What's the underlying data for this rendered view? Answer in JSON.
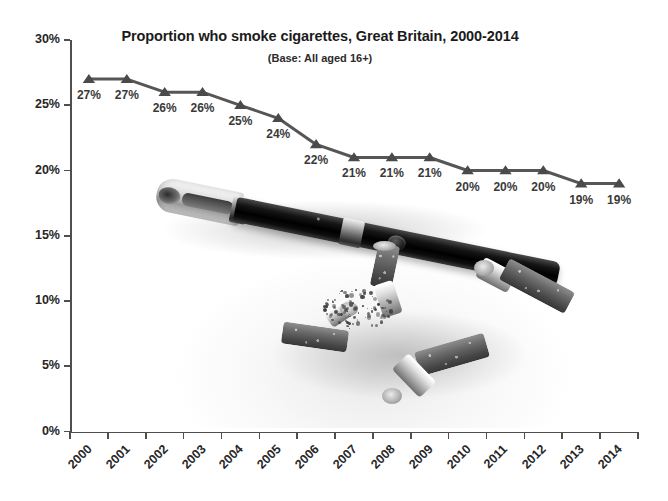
{
  "chart_data": {
    "type": "line",
    "title": "Proportion who smoke cigarettes, Great Britain, 2000-2014",
    "subtitle": "(Base: All aged 16+)",
    "xlabel": "",
    "ylabel": "",
    "categories": [
      "2000",
      "2001",
      "2002",
      "2003",
      "2004",
      "2005",
      "2006",
      "2007",
      "2008",
      "2009",
      "2010",
      "2011",
      "2012",
      "2013",
      "2014"
    ],
    "values": [
      27,
      27,
      26,
      26,
      25,
      24,
      22,
      21,
      21,
      21,
      20,
      20,
      20,
      19,
      19
    ],
    "data_labels": [
      "27%",
      "27%",
      "26%",
      "26%",
      "25%",
      "24%",
      "22%",
      "21%",
      "21%",
      "21%",
      "20%",
      "20%",
      "20%",
      "19%",
      "19%"
    ],
    "ylim": [
      0,
      30
    ],
    "ytick_values": [
      0,
      5,
      10,
      15,
      20,
      25,
      30
    ],
    "ytick_labels": [
      "0%",
      "5%",
      "10%",
      "15%",
      "20%",
      "25%",
      "30%"
    ],
    "grid": false,
    "legend": "none",
    "series_color": "#565656",
    "marker": "triangle",
    "marker_color": "#4a4a4a"
  },
  "figure": {
    "background_color": "#ffffff",
    "axis_color": "#4f4f4f",
    "title_color": "#1b1b1b",
    "label_color": "#262626"
  },
  "photo": {
    "caption_alt": "Black electronic cigarette above four crushed cigarette butts with scattered ash",
    "items": [
      {
        "name": "e-cigarette"
      },
      {
        "name": "cigarette-butt-a"
      },
      {
        "name": "cigarette-butt-b"
      },
      {
        "name": "cigarette-butt-c"
      },
      {
        "name": "cigarette-butt-d"
      },
      {
        "name": "ash-pile"
      }
    ]
  }
}
